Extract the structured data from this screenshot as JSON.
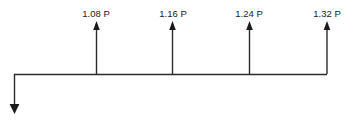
{
  "diagram": {
    "type": "structural-load-diagram",
    "background_color": "#ffffff",
    "line_color": "#2b2b2b",
    "text_color": "#1a1a1a",
    "baseline": {
      "name": "horizontal-beam-line",
      "x_start": 14,
      "x_end": 327,
      "y": 74
    },
    "reaction": {
      "label": "",
      "direction": "down",
      "x": 14,
      "y_top": 74,
      "y_tip": 114
    },
    "forces": [
      {
        "label": "1.08 P",
        "x": 96,
        "y_tip": 21,
        "y_base": 74,
        "direction": "up",
        "label_x": 96,
        "label_y": 17
      },
      {
        "label": "1.16 P",
        "x": 172,
        "y_tip": 21,
        "y_base": 74,
        "direction": "up",
        "label_x": 173,
        "label_y": 17
      },
      {
        "label": "1.24 P",
        "x": 249,
        "y_tip": 21,
        "y_base": 74,
        "direction": "up",
        "label_x": 249,
        "label_y": 17
      },
      {
        "label": "1.32 P",
        "x": 327,
        "y_tip": 21,
        "y_base": 74,
        "direction": "up",
        "label_x": 327,
        "label_y": 17
      }
    ]
  }
}
